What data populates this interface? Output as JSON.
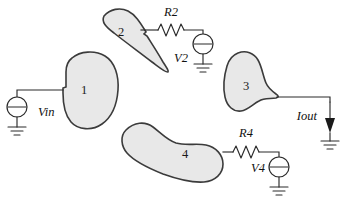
{
  "diagram": {
    "background_color": "#ffffff",
    "blob_fill_color": "#e8e8e8",
    "blob_stroke_color": "#3b3b3b",
    "wire_color": "#2b2b2b"
  },
  "regions": [
    {
      "id": "region-1",
      "label": "1",
      "label_x": 84,
      "label_y": 94
    },
    {
      "id": "region-2",
      "label": "2",
      "label_x": 121,
      "label_y": 36
    },
    {
      "id": "region-3",
      "label": "3",
      "label_x": 246,
      "label_y": 90
    },
    {
      "id": "region-4",
      "label": "4",
      "label_x": 185,
      "label_y": 158
    }
  ],
  "sources": [
    {
      "id": "source-vin",
      "label": "Vin",
      "label_x": 38,
      "label_y": 116,
      "type": "voltage-source"
    },
    {
      "id": "source-v2",
      "label": "V2",
      "label_x": 170,
      "label_y": 62,
      "type": "voltage-source"
    },
    {
      "id": "source-v4",
      "label": "V4",
      "label_x": 252,
      "label_y": 180,
      "type": "voltage-source"
    }
  ],
  "resistors": [
    {
      "id": "resistor-r2",
      "label": "R2",
      "label_x": 163,
      "label_y": 16,
      "type": "resistor"
    },
    {
      "id": "resistor-r4",
      "label": "R4",
      "label_x": 233,
      "label_y": 137,
      "type": "resistor"
    }
  ],
  "currents": [
    {
      "id": "current-iout",
      "label": "Iout",
      "label_x": 287,
      "label_y": 119,
      "type": "current-arrow"
    }
  ],
  "grounds": [
    {
      "id": "ground-vin"
    },
    {
      "id": "ground-v2"
    },
    {
      "id": "ground-v4"
    },
    {
      "id": "ground-iout"
    }
  ]
}
